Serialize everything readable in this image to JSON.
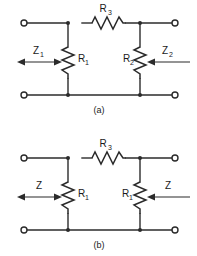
{
  "figure": {
    "background_color": "#ffffff",
    "line_color": "#2b2b2b",
    "panels": [
      {
        "id": "panel-a",
        "caption": "(a)",
        "series_resistor": {
          "name": "R3",
          "label": "R",
          "subscript": "3",
          "orientation": "horizontal"
        },
        "shunt_left": {
          "name": "R1",
          "label": "R",
          "subscript": "1",
          "orientation": "vertical"
        },
        "shunt_right": {
          "name": "R2",
          "label": "R",
          "subscript": "2",
          "orientation": "vertical"
        },
        "impedance_left": {
          "label": "Z",
          "subscript": "1",
          "arrow": "double"
        },
        "impedance_right": {
          "label": "Z",
          "subscript": "2",
          "arrow": "left"
        }
      },
      {
        "id": "panel-b",
        "caption": "(b)",
        "series_resistor": {
          "name": "R3",
          "label": "R",
          "subscript": "3",
          "orientation": "horizontal"
        },
        "shunt_left": {
          "name": "R1",
          "label": "R",
          "subscript": "1",
          "orientation": "vertical"
        },
        "shunt_right": {
          "name": "R1",
          "label": "R",
          "subscript": "1",
          "orientation": "vertical"
        },
        "impedance_left": {
          "label": "Z",
          "subscript": "",
          "arrow": "double"
        },
        "impedance_right": {
          "label": "Z",
          "subscript": "",
          "arrow": "left"
        }
      }
    ]
  }
}
